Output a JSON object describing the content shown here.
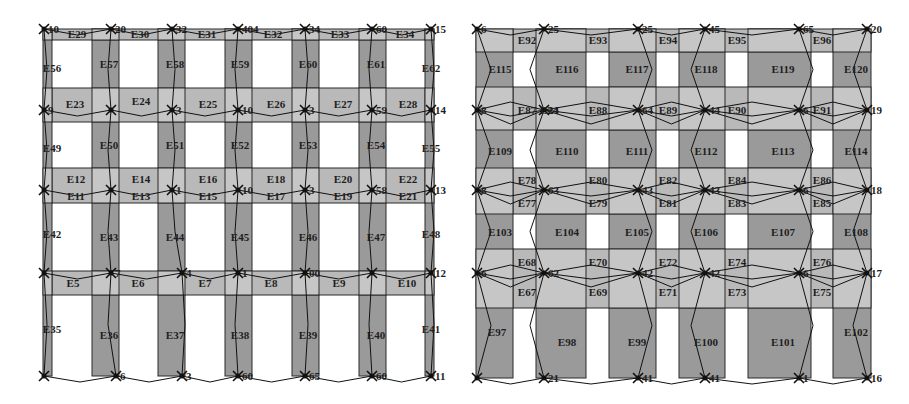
{
  "colors": {
    "column_fill": "#9a9a9a",
    "beam_fill": "#b9b9b9",
    "panel_fill": "#c6c6c6",
    "stroke": "#2a2a2a",
    "background": "#ffffff"
  },
  "left_frame": {
    "columns": [
      {
        "x": 43,
        "w": 9
      },
      {
        "x": 92,
        "w": 27
      },
      {
        "x": 158,
        "w": 27
      },
      {
        "x": 225,
        "w": 27
      },
      {
        "x": 292,
        "w": 27
      },
      {
        "x": 359,
        "w": 27
      },
      {
        "x": 425,
        "w": 9
      }
    ],
    "col_top": 29,
    "col_bottom": 376,
    "beams": [
      {
        "y1": 29,
        "y2": 40
      },
      {
        "y1": 88,
        "y2": 122
      },
      {
        "y1": 168,
        "y2": 203
      },
      {
        "y1": 271,
        "y2": 295
      }
    ],
    "beam_x1": 52,
    "beam_x2": 425,
    "floor_y": [
      29,
      110,
      190,
      273,
      376
    ],
    "node_x": [
      44,
      111,
      172,
      238,
      305,
      372,
      431
    ],
    "nodes": [
      {
        "x": 44,
        "y": 29,
        "label": "10"
      },
      {
        "x": 111,
        "y": 29,
        "label": "20"
      },
      {
        "x": 172,
        "y": 29,
        "label": "32"
      },
      {
        "x": 238,
        "y": 29,
        "label": "404"
      },
      {
        "x": 305,
        "y": 29,
        "label": "34"
      },
      {
        "x": 372,
        "y": 29,
        "label": "60"
      },
      {
        "x": 431,
        "y": 29,
        "label": "15"
      },
      {
        "x": 44,
        "y": 110,
        "label": "9"
      },
      {
        "x": 111,
        "y": 110,
        "label": ""
      },
      {
        "x": 172,
        "y": 110,
        "label": "3"
      },
      {
        "x": 238,
        "y": 110,
        "label": "10"
      },
      {
        "x": 305,
        "y": 110,
        "label": "3"
      },
      {
        "x": 372,
        "y": 110,
        "label": "59"
      },
      {
        "x": 431,
        "y": 110,
        "label": "14"
      },
      {
        "x": 44,
        "y": 190,
        "label": ""
      },
      {
        "x": 111,
        "y": 190,
        "label": ""
      },
      {
        "x": 172,
        "y": 190,
        "label": "1"
      },
      {
        "x": 238,
        "y": 190,
        "label": "10"
      },
      {
        "x": 305,
        "y": 190,
        "label": "3"
      },
      {
        "x": 372,
        "y": 190,
        "label": "58"
      },
      {
        "x": 431,
        "y": 190,
        "label": "13"
      },
      {
        "x": 44,
        "y": 273,
        "label": ""
      },
      {
        "x": 111,
        "y": 273,
        "label": "7"
      },
      {
        "x": 182,
        "y": 273,
        "label": "4"
      },
      {
        "x": 238,
        "y": 273,
        "label": "1"
      },
      {
        "x": 305,
        "y": 273,
        "label": "00"
      },
      {
        "x": 372,
        "y": 273,
        "label": ""
      },
      {
        "x": 431,
        "y": 273,
        "label": "12"
      },
      {
        "x": 44,
        "y": 376,
        "label": ""
      },
      {
        "x": 116,
        "y": 376,
        "label": "6"
      },
      {
        "x": 182,
        "y": 376,
        "label": "3"
      },
      {
        "x": 238,
        "y": 376,
        "label": "60"
      },
      {
        "x": 305,
        "y": 376,
        "label": "65"
      },
      {
        "x": 372,
        "y": 376,
        "label": "60"
      },
      {
        "x": 431,
        "y": 376,
        "label": "11"
      }
    ],
    "element_labels": [
      {
        "t": "E29",
        "x": 77,
        "y": 38
      },
      {
        "t": "E30",
        "x": 140,
        "y": 38
      },
      {
        "t": "E31",
        "x": 207,
        "y": 38
      },
      {
        "t": "E32",
        "x": 273,
        "y": 38
      },
      {
        "t": "E33",
        "x": 340,
        "y": 38
      },
      {
        "t": "E34",
        "x": 405,
        "y": 38
      },
      {
        "t": "E56",
        "x": 52,
        "y": 72
      },
      {
        "t": "E57",
        "x": 109,
        "y": 68
      },
      {
        "t": "E58",
        "x": 175,
        "y": 68
      },
      {
        "t": "E59",
        "x": 240,
        "y": 68
      },
      {
        "t": "E60",
        "x": 308,
        "y": 68
      },
      {
        "t": "E61",
        "x": 376,
        "y": 68
      },
      {
        "t": "E62",
        "x": 431,
        "y": 72
      },
      {
        "t": "E23",
        "x": 75,
        "y": 108
      },
      {
        "t": "E24",
        "x": 141,
        "y": 105
      },
      {
        "t": "E25",
        "x": 208,
        "y": 108
      },
      {
        "t": "E26",
        "x": 276,
        "y": 108
      },
      {
        "t": "E27",
        "x": 343,
        "y": 108
      },
      {
        "t": "E28",
        "x": 408,
        "y": 108
      },
      {
        "t": "E49",
        "x": 52,
        "y": 152
      },
      {
        "t": "E50",
        "x": 109,
        "y": 149
      },
      {
        "t": "E51",
        "x": 175,
        "y": 149
      },
      {
        "t": "E52",
        "x": 240,
        "y": 149
      },
      {
        "t": "E53",
        "x": 308,
        "y": 149
      },
      {
        "t": "E54",
        "x": 376,
        "y": 149
      },
      {
        "t": "E55",
        "x": 431,
        "y": 152
      },
      {
        "t": "E12",
        "x": 76,
        "y": 183
      },
      {
        "t": "E14",
        "x": 141,
        "y": 183
      },
      {
        "t": "E16",
        "x": 208,
        "y": 183
      },
      {
        "t": "E18",
        "x": 276,
        "y": 183
      },
      {
        "t": "E20",
        "x": 343,
        "y": 183
      },
      {
        "t": "E22",
        "x": 408,
        "y": 183
      },
      {
        "t": "E11",
        "x": 76,
        "y": 200
      },
      {
        "t": "E13",
        "x": 141,
        "y": 200
      },
      {
        "t": "E15",
        "x": 208,
        "y": 200
      },
      {
        "t": "E17",
        "x": 276,
        "y": 200
      },
      {
        "t": "E19",
        "x": 343,
        "y": 200
      },
      {
        "t": "E21",
        "x": 408,
        "y": 200
      },
      {
        "t": "E42",
        "x": 52,
        "y": 238
      },
      {
        "t": "E43",
        "x": 109,
        "y": 241
      },
      {
        "t": "E44",
        "x": 175,
        "y": 241
      },
      {
        "t": "E45",
        "x": 240,
        "y": 241
      },
      {
        "t": "E46",
        "x": 308,
        "y": 241
      },
      {
        "t": "E47",
        "x": 376,
        "y": 241
      },
      {
        "t": "E48",
        "x": 431,
        "y": 238
      },
      {
        "t": "E5",
        "x": 73,
        "y": 287
      },
      {
        "t": "E6",
        "x": 138,
        "y": 287
      },
      {
        "t": "E7",
        "x": 205,
        "y": 287
      },
      {
        "t": "E8",
        "x": 271,
        "y": 287
      },
      {
        "t": "E9",
        "x": 339,
        "y": 287
      },
      {
        "t": "E10",
        "x": 407,
        "y": 287
      },
      {
        "t": "E35",
        "x": 52,
        "y": 333
      },
      {
        "t": "E36",
        "x": 109,
        "y": 339
      },
      {
        "t": "E37",
        "x": 175,
        "y": 339
      },
      {
        "t": "E38",
        "x": 240,
        "y": 339
      },
      {
        "t": "E39",
        "x": 308,
        "y": 339
      },
      {
        "t": "E40",
        "x": 376,
        "y": 339
      },
      {
        "t": "E41",
        "x": 431,
        "y": 333
      }
    ]
  },
  "right_frame": {
    "columns": [
      {
        "x": 476,
        "w": 37
      },
      {
        "x": 536,
        "w": 50
      },
      {
        "x": 609,
        "w": 47
      },
      {
        "x": 679,
        "w": 46
      },
      {
        "x": 748,
        "w": 63
      },
      {
        "x": 833,
        "w": 38
      }
    ],
    "col_top": 29,
    "col_bottom": 378,
    "beams": [
      {
        "y1": 29,
        "y2": 52
      },
      {
        "y1": 87,
        "y2": 130
      },
      {
        "y1": 168,
        "y2": 214
      },
      {
        "y1": 249,
        "y2": 308
      }
    ],
    "beam_x1": 513,
    "beam_x2": 833,
    "nodes": [
      {
        "x": 477,
        "y": 29,
        "label": "6"
      },
      {
        "x": 544,
        "y": 29,
        "label": "25"
      },
      {
        "x": 638,
        "y": 29,
        "label": "25"
      },
      {
        "x": 705,
        "y": 29,
        "label": "45"
      },
      {
        "x": 799,
        "y": 29,
        "label": "65"
      },
      {
        "x": 867,
        "y": 29,
        "label": "20"
      },
      {
        "x": 477,
        "y": 110,
        "label": "8"
      },
      {
        "x": 544,
        "y": 110,
        "label": "24"
      },
      {
        "x": 638,
        "y": 110,
        "label": "64"
      },
      {
        "x": 705,
        "y": 110,
        "label": "44"
      },
      {
        "x": 799,
        "y": 110,
        "label": "6"
      },
      {
        "x": 867,
        "y": 110,
        "label": "19"
      },
      {
        "x": 477,
        "y": 190,
        "label": "8"
      },
      {
        "x": 544,
        "y": 190,
        "label": "63"
      },
      {
        "x": 638,
        "y": 190,
        "label": "43"
      },
      {
        "x": 705,
        "y": 190,
        "label": "43"
      },
      {
        "x": 799,
        "y": 190,
        "label": "6"
      },
      {
        "x": 867,
        "y": 190,
        "label": "18"
      },
      {
        "x": 477,
        "y": 273,
        "label": "6"
      },
      {
        "x": 544,
        "y": 273,
        "label": "62"
      },
      {
        "x": 638,
        "y": 273,
        "label": "42"
      },
      {
        "x": 705,
        "y": 273,
        "label": "42"
      },
      {
        "x": 799,
        "y": 273,
        "label": "6"
      },
      {
        "x": 867,
        "y": 273,
        "label": "17"
      },
      {
        "x": 477,
        "y": 378,
        "label": ""
      },
      {
        "x": 544,
        "y": 378,
        "label": "21"
      },
      {
        "x": 638,
        "y": 378,
        "label": "41"
      },
      {
        "x": 705,
        "y": 378,
        "label": "41"
      },
      {
        "x": 799,
        "y": 378,
        "label": "1"
      },
      {
        "x": 867,
        "y": 378,
        "label": "16"
      }
    ],
    "element_labels": [
      {
        "t": "E92",
        "x": 527,
        "y": 44
      },
      {
        "t": "E93",
        "x": 598,
        "y": 44
      },
      {
        "t": "E94",
        "x": 668,
        "y": 44
      },
      {
        "t": "E95",
        "x": 737,
        "y": 44
      },
      {
        "t": "E96",
        "x": 822,
        "y": 44
      },
      {
        "t": "E115",
        "x": 500,
        "y": 73
      },
      {
        "t": "E116",
        "x": 567,
        "y": 73
      },
      {
        "t": "E117",
        "x": 637,
        "y": 73
      },
      {
        "t": "E118",
        "x": 706,
        "y": 73
      },
      {
        "t": "E119",
        "x": 783,
        "y": 73
      },
      {
        "t": "E120",
        "x": 856,
        "y": 73
      },
      {
        "t": "E87",
        "x": 527,
        "y": 114
      },
      {
        "t": "E24",
        "x": 549,
        "y": 114
      },
      {
        "t": "E88",
        "x": 598,
        "y": 114
      },
      {
        "t": "E89",
        "x": 668,
        "y": 114
      },
      {
        "t": "E90",
        "x": 737,
        "y": 114
      },
      {
        "t": "E91",
        "x": 822,
        "y": 114
      },
      {
        "t": "E109",
        "x": 500,
        "y": 155
      },
      {
        "t": "E110",
        "x": 567,
        "y": 155
      },
      {
        "t": "E111",
        "x": 637,
        "y": 155
      },
      {
        "t": "E112",
        "x": 706,
        "y": 155
      },
      {
        "t": "E113",
        "x": 783,
        "y": 155
      },
      {
        "t": "E114",
        "x": 856,
        "y": 155
      },
      {
        "t": "E78",
        "x": 527,
        "y": 184
      },
      {
        "t": "E80",
        "x": 598,
        "y": 184
      },
      {
        "t": "E82",
        "x": 668,
        "y": 184
      },
      {
        "t": "E84",
        "x": 737,
        "y": 184
      },
      {
        "t": "E86",
        "x": 822,
        "y": 184
      },
      {
        "t": "E77",
        "x": 527,
        "y": 207
      },
      {
        "t": "E79",
        "x": 598,
        "y": 207
      },
      {
        "t": "E81",
        "x": 668,
        "y": 207
      },
      {
        "t": "E83",
        "x": 737,
        "y": 207
      },
      {
        "t": "E85",
        "x": 822,
        "y": 207
      },
      {
        "t": "E103",
        "x": 500,
        "y": 236
      },
      {
        "t": "E104",
        "x": 567,
        "y": 236
      },
      {
        "t": "E105",
        "x": 637,
        "y": 236
      },
      {
        "t": "E106",
        "x": 706,
        "y": 236
      },
      {
        "t": "E107",
        "x": 783,
        "y": 236
      },
      {
        "t": "E108",
        "x": 856,
        "y": 236
      },
      {
        "t": "E68",
        "x": 527,
        "y": 266
      },
      {
        "t": "E70",
        "x": 598,
        "y": 266
      },
      {
        "t": "E72",
        "x": 668,
        "y": 266
      },
      {
        "t": "E74",
        "x": 737,
        "y": 266
      },
      {
        "t": "E76",
        "x": 822,
        "y": 266
      },
      {
        "t": "E67",
        "x": 527,
        "y": 296
      },
      {
        "t": "E69",
        "x": 598,
        "y": 296
      },
      {
        "t": "E71",
        "x": 668,
        "y": 296
      },
      {
        "t": "E73",
        "x": 737,
        "y": 296
      },
      {
        "t": "E75",
        "x": 822,
        "y": 296
      },
      {
        "t": "E97",
        "x": 497,
        "y": 336
      },
      {
        "t": "E98",
        "x": 567,
        "y": 346
      },
      {
        "t": "E99",
        "x": 637,
        "y": 346
      },
      {
        "t": "E100",
        "x": 706,
        "y": 346
      },
      {
        "t": "E101",
        "x": 783,
        "y": 346
      },
      {
        "t": "E102",
        "x": 856,
        "y": 336
      }
    ]
  }
}
